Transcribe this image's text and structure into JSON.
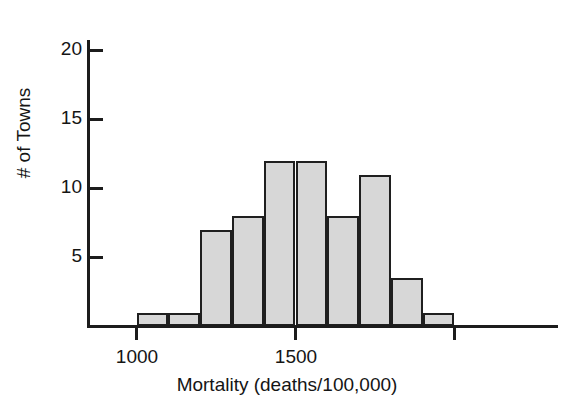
{
  "chart_data": {
    "type": "bar",
    "title": "",
    "subtitle": "",
    "xlabel": "Mortality (deaths/100,000)",
    "ylabel": "# of Towns",
    "grid": false,
    "legend": "none",
    "bin_width": 100,
    "xlim": [
      900,
      2200
    ],
    "ylim": [
      0,
      21
    ],
    "xticks": [
      {
        "value": 1000,
        "label": "1000"
      },
      {
        "value": 1500,
        "label": "1500"
      },
      {
        "value": 2000,
        "label": ""
      }
    ],
    "yticks": [
      {
        "value": 5,
        "label": "5"
      },
      {
        "value": 10,
        "label": "10"
      },
      {
        "value": 15,
        "label": "15"
      },
      {
        "value": 20,
        "label": "20"
      }
    ],
    "bins": [
      {
        "label": "1000-1100",
        "x0": 1000,
        "x1": 1100,
        "value": 1
      },
      {
        "label": "1100-1200",
        "x0": 1100,
        "x1": 1200,
        "value": 1
      },
      {
        "label": "1200-1300",
        "x0": 1200,
        "x1": 1300,
        "value": 7
      },
      {
        "label": "1300-1400",
        "x0": 1300,
        "x1": 1400,
        "value": 8
      },
      {
        "label": "1400-1500",
        "x0": 1400,
        "x1": 1500,
        "value": 12
      },
      {
        "label": "1500-1600",
        "x0": 1500,
        "x1": 1600,
        "value": 12
      },
      {
        "label": "1600-1700",
        "x0": 1600,
        "x1": 1700,
        "value": 8
      },
      {
        "label": "1700-1800",
        "x0": 1700,
        "x1": 1800,
        "value": 11
      },
      {
        "label": "1800-1900",
        "x0": 1800,
        "x1": 1900,
        "value": 3.5
      },
      {
        "label": "1900-2000",
        "x0": 1900,
        "x1": 2000,
        "value": 1
      }
    ],
    "categories": [
      "1000-1100",
      "1100-1200",
      "1200-1300",
      "1300-1400",
      "1400-1500",
      "1500-1600",
      "1600-1700",
      "1700-1800",
      "1800-1900",
      "1900-2000"
    ],
    "values": [
      1,
      1,
      7,
      8,
      12,
      12,
      8,
      11,
      3.5,
      1
    ],
    "colors": {
      "bar_fill": "#d7d7d7",
      "bar_stroke": "#1f1f1f",
      "axis": "#1c1c1c",
      "text": "#151515",
      "background": "#ffffff"
    }
  },
  "axis_labels": {
    "x": "Mortality (deaths/100,000)",
    "y": "# of Towns"
  },
  "ytick_labels": {
    "t5": "5",
    "t10": "10",
    "t15": "15",
    "t20": "20"
  },
  "xtick_labels": {
    "t1000": "1000",
    "t1500": "1500"
  }
}
